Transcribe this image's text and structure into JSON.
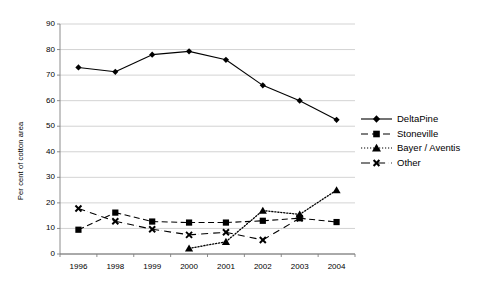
{
  "chart_data": {
    "type": "line",
    "title": "",
    "xlabel": "",
    "ylabel": "Per cent of cotton area",
    "categories": [
      "1996",
      "1998",
      "1999",
      "2000",
      "2001",
      "2002",
      "2003",
      "2004"
    ],
    "ylim": [
      0,
      90
    ],
    "ytick_step": 10,
    "yticks": [
      "0",
      "10",
      "20",
      "30",
      "40",
      "50",
      "60",
      "70",
      "80",
      "90"
    ],
    "grid": true,
    "legend_position": "right",
    "series": [
      {
        "name": "DeltaPine",
        "marker": "diamond",
        "line": "solid",
        "color": "#000000",
        "values": [
          73,
          71.3,
          78,
          79.3,
          76,
          66,
          60,
          52.5
        ]
      },
      {
        "name": "Stoneville",
        "marker": "square",
        "line": "dashed",
        "color": "#000000",
        "values": [
          9.5,
          16.2,
          12.7,
          12.3,
          12.3,
          13,
          14,
          12.5
        ]
      },
      {
        "name": "Bayer / Aventis",
        "marker": "triangle",
        "line": "dotted",
        "color": "#000000",
        "values": [
          null,
          null,
          null,
          2.2,
          4.8,
          17,
          15.5,
          25
        ]
      },
      {
        "name": "Other",
        "marker": "cross",
        "line": "dash-dot",
        "color": "#000000",
        "values": [
          17.8,
          12.8,
          9.7,
          7.5,
          8.5,
          5.5,
          14,
          null
        ]
      }
    ]
  },
  "legend": {
    "items": [
      {
        "label": "DeltaPine"
      },
      {
        "label": "Stoneville"
      },
      {
        "label": "Bayer / Aventis"
      },
      {
        "label": "Other"
      }
    ]
  },
  "axes": {
    "y_title": "Per cent of cotton area"
  },
  "colors": {
    "grid": "#c8c8c8",
    "axis": "#808080",
    "data": "#000000",
    "background": "#ffffff"
  }
}
